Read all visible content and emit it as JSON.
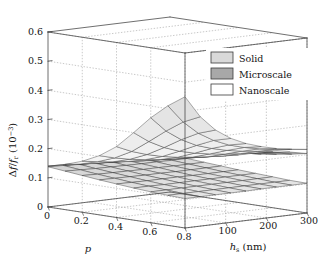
{
  "figure": {
    "background": "#ffffff",
    "axis_color": "#4a4a4a",
    "grid_color": "#9a9a9a"
  },
  "axes": {
    "z": {
      "label_delta": "Δ",
      "label_f": "f",
      "label_slash": "/",
      "label_fr": "f",
      "label_fr_sub": "r",
      "label_units_open": " (10",
      "label_units_exp": "−3",
      "label_units_close": ")",
      "ticks": [
        "0",
        "0.1",
        "0.2",
        "0.3",
        "0.4",
        "0.5",
        "0.6"
      ],
      "range": [
        0,
        0.6
      ]
    },
    "x": {
      "label": "p",
      "ticks": [
        "0",
        "0.2",
        "0.4",
        "0.6",
        "0.8"
      ],
      "range": [
        0,
        0.8
      ]
    },
    "y": {
      "label_h": "h",
      "label_h_sub": "s",
      "label_units": " (nm)",
      "ticks": [
        "100",
        "200",
        "300"
      ],
      "range": [
        0,
        300
      ]
    }
  },
  "legend": {
    "items": [
      {
        "label": "Solid",
        "swatch": "#d9d9d9"
      },
      {
        "label": "Microscale",
        "swatch": "#a8a8a8"
      },
      {
        "label": "Nanoscale",
        "swatch": "#ffffff"
      }
    ]
  },
  "chart_data": {
    "type": "line",
    "plot_kind": "3d-mesh-surface",
    "title": "",
    "xlabel": "p",
    "ylabel": "h_s (nm)",
    "zlabel": "Δf/f_r (10−3)",
    "xlim": [
      0,
      0.8
    ],
    "ylim": [
      0,
      300
    ],
    "zlim": [
      0,
      0.6
    ],
    "grid": true,
    "legend_position": "upper-right-inside",
    "x": [
      0.0,
      0.1,
      0.2,
      0.3,
      0.4,
      0.5,
      0.6,
      0.7,
      0.8
    ],
    "y": [
      0,
      37.5,
      75,
      112.5,
      150,
      187.5,
      225,
      262.5,
      300
    ],
    "series": [
      {
        "name": "Nanoscale",
        "color": "#ffffff",
        "edge": "#3c3c3c",
        "z": [
          [
            0.14,
            0.138,
            0.136,
            0.134,
            0.133,
            0.132,
            0.131,
            0.13,
            0.13
          ],
          [
            0.155,
            0.15,
            0.146,
            0.143,
            0.141,
            0.139,
            0.138,
            0.137,
            0.136
          ],
          [
            0.175,
            0.167,
            0.16,
            0.155,
            0.151,
            0.148,
            0.146,
            0.144,
            0.143
          ],
          [
            0.203,
            0.189,
            0.178,
            0.17,
            0.164,
            0.16,
            0.157,
            0.154,
            0.152
          ],
          [
            0.243,
            0.22,
            0.203,
            0.19,
            0.181,
            0.175,
            0.17,
            0.166,
            0.163
          ],
          [
            0.3,
            0.263,
            0.236,
            0.217,
            0.204,
            0.195,
            0.188,
            0.183,
            0.179
          ],
          [
            0.36,
            0.308,
            0.272,
            0.246,
            0.229,
            0.216,
            0.207,
            0.2,
            0.195
          ],
          [
            0.41,
            0.348,
            0.303,
            0.272,
            0.25,
            0.235,
            0.224,
            0.215,
            0.209
          ],
          [
            0.45,
            0.375,
            0.323,
            0.288,
            0.264,
            0.247,
            0.234,
            0.225,
            0.218
          ]
        ]
      },
      {
        "name": "Microscale",
        "color": "#a8a8a8",
        "edge": "#3c3c3c",
        "z": [
          [
            0.14,
            0.139,
            0.138,
            0.137,
            0.136,
            0.136,
            0.135,
            0.135,
            0.135
          ],
          [
            0.152,
            0.149,
            0.147,
            0.145,
            0.144,
            0.143,
            0.142,
            0.142,
            0.141
          ],
          [
            0.168,
            0.163,
            0.159,
            0.156,
            0.154,
            0.152,
            0.151,
            0.15,
            0.149
          ],
          [
            0.19,
            0.181,
            0.174,
            0.169,
            0.165,
            0.162,
            0.16,
            0.158,
            0.157
          ],
          [
            0.22,
            0.205,
            0.194,
            0.186,
            0.18,
            0.176,
            0.172,
            0.17,
            0.168
          ],
          [
            0.255,
            0.233,
            0.217,
            0.205,
            0.197,
            0.19,
            0.186,
            0.182,
            0.179
          ],
          [
            0.29,
            0.261,
            0.24,
            0.224,
            0.213,
            0.205,
            0.199,
            0.194,
            0.191
          ],
          [
            0.312,
            0.28,
            0.256,
            0.238,
            0.225,
            0.216,
            0.209,
            0.204,
            0.2
          ],
          [
            0.322,
            0.29,
            0.264,
            0.245,
            0.231,
            0.221,
            0.214,
            0.208,
            0.204
          ]
        ]
      },
      {
        "name": "Solid",
        "color": "#d9d9d9",
        "edge": "#2e2e2e",
        "z": [
          [
            0.138,
            0.136,
            0.134,
            0.132,
            0.131,
            0.13,
            0.129,
            0.129,
            0.128
          ],
          [
            0.132,
            0.13,
            0.128,
            0.127,
            0.126,
            0.125,
            0.125,
            0.124,
            0.124
          ],
          [
            0.126,
            0.124,
            0.123,
            0.122,
            0.121,
            0.121,
            0.12,
            0.12,
            0.12
          ],
          [
            0.12,
            0.119,
            0.118,
            0.117,
            0.117,
            0.116,
            0.116,
            0.116,
            0.116
          ],
          [
            0.115,
            0.114,
            0.113,
            0.113,
            0.113,
            0.112,
            0.112,
            0.112,
            0.112
          ],
          [
            0.11,
            0.11,
            0.109,
            0.109,
            0.109,
            0.109,
            0.109,
            0.109,
            0.109
          ],
          [
            0.106,
            0.106,
            0.106,
            0.106,
            0.106,
            0.106,
            0.106,
            0.106,
            0.106
          ],
          [
            0.103,
            0.103,
            0.103,
            0.103,
            0.103,
            0.103,
            0.103,
            0.103,
            0.103
          ],
          [
            0.101,
            0.101,
            0.101,
            0.101,
            0.101,
            0.102,
            0.102,
            0.102,
            0.102
          ]
        ]
      }
    ]
  }
}
